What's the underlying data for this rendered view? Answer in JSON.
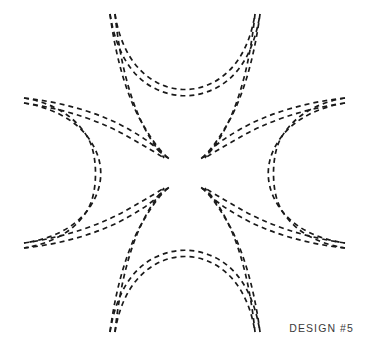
{
  "page": {
    "background_color": "#ffffff",
    "width": 367,
    "height": 346
  },
  "caption": {
    "text": "DESIGN #5",
    "color": "#3a3a3a",
    "position": "bottom-right"
  },
  "artwork": {
    "name": "four-lobe-dashed-star",
    "description": "Four-fold symmetric dashed-line design: four pointed crescent lobes (top, left, right, bottom) each drawn as a pair of nearly parallel dashed curves converging to sharp tips near the center.",
    "stroke_color": "#1a1a1a",
    "stroke_width": 1.7,
    "dash_pattern": "5 4",
    "symmetry": "4-fold (horizontal and vertical mirror)",
    "lobe_count": 4,
    "curve_count": 8,
    "center": [
      185.5,
      174
    ],
    "inner_tips": [
      [
        168,
        158
      ],
      [
        203,
        158
      ],
      [
        168,
        190
      ],
      [
        203,
        190
      ]
    ],
    "outer_tips": [
      [
        114,
        14
      ],
      [
        256,
        14
      ],
      [
        24,
        99
      ],
      [
        345,
        99
      ],
      [
        24,
        247
      ],
      [
        345,
        247
      ],
      [
        114,
        332
      ],
      [
        256,
        332
      ]
    ],
    "paths": [
      {
        "name": "top-lobe-left-outer",
        "d": "M 115 14 C 119 54 128 95 143 125 C 155 149 163 156 170 159"
      },
      {
        "name": "top-lobe-left-inner",
        "d": "M 110 14 C 116 60 128 101 145 128 C 157 148 164 155 170 159"
      },
      {
        "name": "top-lobe-right-outer",
        "d": "M 255 14 C 251 54 242 95 227 125 C 215 149 207 156 200 159"
      },
      {
        "name": "top-lobe-right-inner",
        "d": "M 260 14 C 254 60 242 101 225 128 C 213 148 206 155 200 159"
      },
      {
        "name": "top-arc-outer",
        "d": "M 115 14 C 120 46 134 70 156 82 C 174 92 196 92 214 82 C 236 70 250 46 255 14"
      },
      {
        "name": "top-arc-inner",
        "d": "M 110 14 C 116 52 132 78 156 89 C 175 98 195 98 214 89 C 238 78 254 52 260 14"
      },
      {
        "name": "left-lobe-top-outer",
        "d": "M 24 98 C 62 102 101 113 130 130 C 153 143 160 151 164 158"
      },
      {
        "name": "left-lobe-top-inner",
        "d": "M 24 103 C 66 109 104 122 132 139 C 152 150 159 155 164 158"
      },
      {
        "name": "left-lobe-bottom-outer",
        "d": "M 24 248 C 62 244 101 233 130 216 C 153 203 160 195 164 188"
      },
      {
        "name": "left-lobe-bottom-inner",
        "d": "M 24 243 C 66 237 104 224 132 207 C 152 196 159 191 164 188"
      },
      {
        "name": "left-arc-outer",
        "d": "M 24 98 C 54 103 76 117 88 138 C 98 155 98 192 88 209 C 76 230 54 243 24 248"
      },
      {
        "name": "left-arc-inner",
        "d": "M 24 103 C 59 109 83 125 94 147 C 103 164 103 183 94 200 C 83 222 59 238 24 243"
      },
      {
        "name": "right-lobe-top-outer",
        "d": "M 345 98 C 307 102 268 113 239 130 C 216 143 209 151 205 158"
      },
      {
        "name": "right-lobe-top-inner",
        "d": "M 345 103 C 303 109 265 122 237 139 C 217 150 210 155 205 158"
      },
      {
        "name": "right-lobe-bottom-outer",
        "d": "M 345 248 C 307 244 268 233 239 216 C 216 203 209 195 205 188"
      },
      {
        "name": "right-lobe-bottom-inner",
        "d": "M 345 243 C 303 237 265 224 237 207 C 217 196 210 191 205 188"
      },
      {
        "name": "right-arc-outer",
        "d": "M 345 98 C 315 103 293 117 281 138 C 271 155 271 192 281 209 C 293 230 315 243 345 248"
      },
      {
        "name": "right-arc-inner",
        "d": "M 345 103 C 310 109 286 125 275 147 C 266 164 266 183 275 200 C 286 222 310 238 345 243"
      },
      {
        "name": "bottom-lobe-left-outer",
        "d": "M 115 332 C 119 292 128 251 143 221 C 155 197 163 190 170 187"
      },
      {
        "name": "bottom-lobe-left-inner",
        "d": "M 110 332 C 116 286 128 245 145 218 C 157 198 164 191 170 187"
      },
      {
        "name": "bottom-lobe-right-outer",
        "d": "M 255 332 C 251 292 242 251 227 221 C 215 197 207 190 200 187"
      },
      {
        "name": "bottom-lobe-right-inner",
        "d": "M 260 332 C 254 286 242 245 225 218 C 213 198 206 191 200 187"
      },
      {
        "name": "bottom-arc-outer",
        "d": "M 115 332 C 120 300 134 276 156 264 C 174 254 196 254 214 264 C 236 276 250 300 255 332"
      },
      {
        "name": "bottom-arc-inner",
        "d": "M 110 332 C 116 294 132 268 156 257 C 175 248 195 248 214 257 C 238 268 254 294 260 332"
      }
    ]
  }
}
